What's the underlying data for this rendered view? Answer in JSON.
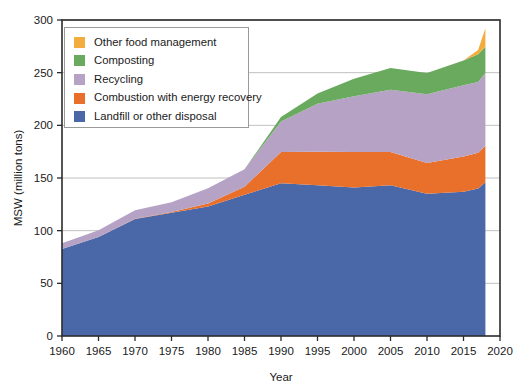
{
  "chart_data": {
    "type": "area",
    "stacked": true,
    "title": "",
    "subtitle": "",
    "xlabel": "Year",
    "ylabel": "MSW (million tons)",
    "xlim": [
      1960,
      2020
    ],
    "ylim": [
      0,
      300
    ],
    "xticks": [
      1960,
      1965,
      1970,
      1975,
      1980,
      1985,
      1990,
      1995,
      2000,
      2005,
      2010,
      2015,
      2020
    ],
    "yticks": [
      0,
      50,
      100,
      150,
      200,
      250,
      300
    ],
    "grid": "horizontal",
    "legend_position": "upper-left-inside",
    "x": [
      1960,
      1965,
      1970,
      1975,
      1980,
      1985,
      1990,
      1995,
      2000,
      2005,
      2010,
      2015,
      2017,
      2018
    ],
    "series": [
      {
        "name": "Landfill or other disposal",
        "color": "#4a68a8",
        "values": [
          82.5,
          94,
          111,
          117,
          123,
          134,
          145,
          143,
          141,
          143,
          135,
          137,
          140,
          146
        ]
      },
      {
        "name": "Combustion with energy recovery",
        "color": "#e8702a",
        "values": [
          0,
          0,
          0.4,
          0.7,
          2.7,
          7.6,
          29.7,
          32.0,
          33.7,
          31.6,
          29.3,
          33.5,
          34.0,
          34.6
        ]
      },
      {
        "name": "Recycling",
        "color": "#b6a2c4",
        "values": [
          5.6,
          6.4,
          8.0,
          9.3,
          14.5,
          16.7,
          29.0,
          45.6,
          53.0,
          59.2,
          65.3,
          67.6,
          67.2,
          69.0
        ]
      },
      {
        "name": "Composting",
        "color": "#6aaa5e",
        "values": [
          0,
          0,
          0,
          0,
          0,
          0,
          4.2,
          9.6,
          16.5,
          20.6,
          20.2,
          23.4,
          26.3,
          24.9
        ]
      },
      {
        "name": "Other food management",
        "color": "#f2ad3e",
        "values": [
          0,
          0,
          0,
          0,
          0,
          0,
          0,
          0,
          0,
          0,
          0,
          0,
          4.0,
          17.7
        ]
      }
    ],
    "totals": [
      88.1,
      100.4,
      119.4,
      127.0,
      140.2,
      158.3,
      207.9,
      230.2,
      244.2,
      254.4,
      249.8,
      261.5,
      271.5,
      292.2
    ],
    "legend": [
      {
        "label": "Other food management",
        "color": "#f2ad3e"
      },
      {
        "label": "Composting",
        "color": "#6aaa5e"
      },
      {
        "label": "Recycling",
        "color": "#b6a2c4"
      },
      {
        "label": "Combustion with energy recovery",
        "color": "#e8702a"
      },
      {
        "label": "Landfill or other disposal",
        "color": "#4a68a8"
      }
    ]
  }
}
